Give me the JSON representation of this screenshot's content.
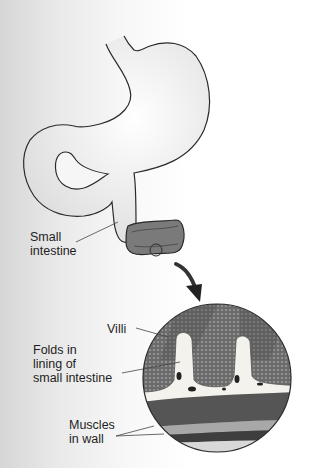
{
  "diagram": {
    "labels": {
      "small_intestine": "Small\nintestine",
      "villi": "Villi",
      "folds": "Folds in\nlining of\nsmall intestine",
      "muscles": "Muscles\nin wall"
    },
    "colors": {
      "outline": "#2a2a2a",
      "organ_fill": "#f2f2f2",
      "intestine_lumen": "#6a6a6a",
      "villi_texture": "#5a5a5a",
      "muscle_dark": "#4a4a4a",
      "background_left": "#d6d6d6"
    }
  }
}
